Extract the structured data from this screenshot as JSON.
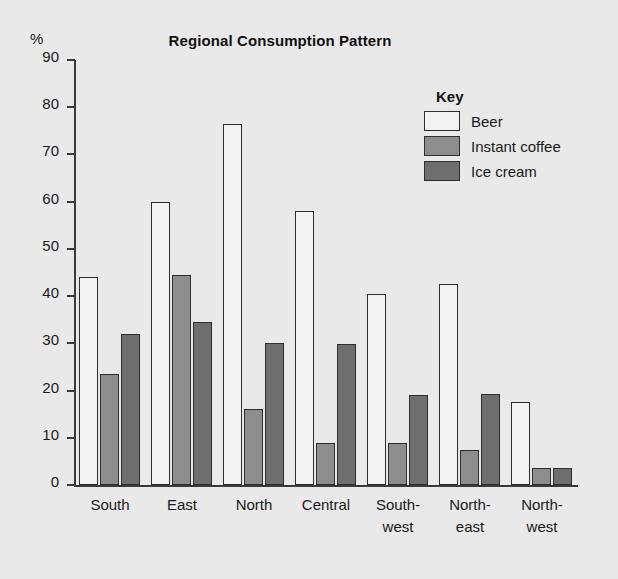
{
  "chart_data": {
    "type": "bar",
    "title": "Regional Consumption Pattern",
    "xlabel": "",
    "ylabel": "%",
    "ylim": [
      0,
      90
    ],
    "ytick_step": 10,
    "yticks": [
      90,
      80,
      70,
      60,
      50,
      40,
      30,
      20,
      10,
      0
    ],
    "grid": false,
    "legend_position": "top-right",
    "legend_title": "Key",
    "categories": [
      "South",
      "East",
      "North",
      "Central",
      "South-west",
      "North-east",
      "North-west"
    ],
    "category_lines": [
      [
        "South",
        ""
      ],
      [
        "East",
        ""
      ],
      [
        "North",
        ""
      ],
      [
        "Central",
        ""
      ],
      [
        "South-",
        "west"
      ],
      [
        "North-",
        "east"
      ],
      [
        "North-",
        "west"
      ]
    ],
    "series": [
      {
        "name": "Beer",
        "color": "#f2f2f2",
        "values": [
          44,
          60,
          76.5,
          58,
          40.5,
          42.5,
          17.5
        ]
      },
      {
        "name": "Instant coffee",
        "color": "#8d8d8d",
        "values": [
          23.5,
          44.5,
          16,
          9,
          8.8,
          7.5,
          3.5
        ]
      },
      {
        "name": "Ice cream",
        "color": "#6e6e6e",
        "values": [
          32,
          34.5,
          30,
          29.8,
          19,
          19.2,
          3.5
        ]
      }
    ]
  },
  "colors": {
    "background": "#e9e9e9",
    "axis": "#3a3a3a",
    "text": "#1a1a1a",
    "bar_outline": "#2e2e2e"
  }
}
